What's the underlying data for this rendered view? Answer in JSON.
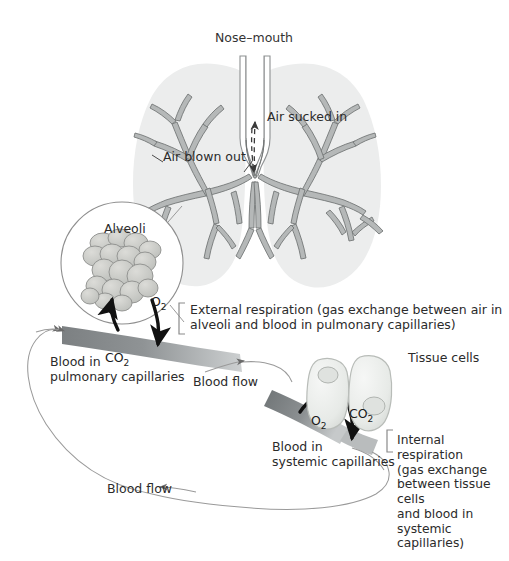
{
  "figure": {
    "title": "Nose–mouth",
    "background_color": "#ffffff",
    "text_color": "#2b2b2b"
  },
  "airway_labels": {
    "air_sucked_in": "Air sucked in",
    "air_blown_out": "Air blown out"
  },
  "alveoli_inset": {
    "title": "Alveoli",
    "gas_label": "O",
    "gas_sub": "2"
  },
  "pulmonary": {
    "gas_label": "CO",
    "gas_sub": "2",
    "vessel_label_line1": "Blood in",
    "vessel_label_line2": "pulmonary capillaries",
    "process_line1": "External respiration (gas exchange between air in",
    "process_line2": "alveoli and blood in pulmonary capillaries)"
  },
  "systemic": {
    "gas_label": "O",
    "gas_sub": "2",
    "tissue_gas_label": "CO",
    "tissue_gas_sub": "2",
    "tissue_cells_label": "Tissue cells",
    "vessel_label_line1": "Blood in",
    "vessel_label_line2": "systemic capillaries",
    "process_lines": "Internal\nrespiration\n(gas exchange\nbetween tissue\ncells\nand blood in\nsystemic\ncapillaries)"
  },
  "flow": {
    "upper_label": "Blood flow",
    "lower_label": "Blood flow"
  },
  "colors": {
    "lung_fill": "#eceded",
    "bronchi_fill": "#b5b8b8",
    "bronchi_stroke": "#6f7373",
    "alveoli_fill": "#c8c9c6",
    "alveoli_stroke": "#8d8f8c",
    "vessel_dark": "#6e7273",
    "vessel_light": "#c9cccd",
    "cell_fill": "#eef0ee",
    "cell_stroke": "#b8bcb8",
    "arrow_black": "#111111",
    "thin_line": "#9a9a9a"
  }
}
